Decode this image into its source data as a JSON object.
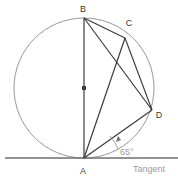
{
  "figure": {
    "background_color": "#ffffff",
    "canvas": {
      "width": 178,
      "height": 180
    }
  },
  "colors": {
    "circle_stroke": "#8c8c8c",
    "chord_stroke": "#3b3b3b",
    "tangent_stroke": "#6e6e6e",
    "label_text": "#3b3b3b",
    "muted_text": "#9a9a9a",
    "center_marker": "#3b3b3b"
  },
  "circle": {
    "center": {
      "x": 84,
      "y": 88
    },
    "radius": 70
  },
  "center_marker": {
    "name": "circle-center-dot",
    "x": 84,
    "y": 88,
    "size": 4
  },
  "points": [
    {
      "id": "B",
      "label": "B",
      "x": 84,
      "y": 18,
      "label_x": 83,
      "label_y": 12
    },
    {
      "id": "C",
      "label": "C",
      "x": 125,
      "y": 38,
      "label_x": 129,
      "label_y": 26
    },
    {
      "id": "D",
      "label": "D",
      "x": 152,
      "y": 110,
      "label_x": 159,
      "label_y": 118
    },
    {
      "id": "A",
      "label": "A",
      "x": 84,
      "y": 158,
      "label_x": 81,
      "label_y": 173
    }
  ],
  "chords": [
    {
      "from": "A",
      "to": "B",
      "x1": 84,
      "y1": 158,
      "x2": 84,
      "y2": 18
    },
    {
      "from": "B",
      "to": "C",
      "x1": 84,
      "y1": 18,
      "x2": 125,
      "y2": 38
    },
    {
      "from": "B",
      "to": "D",
      "x1": 84,
      "y1": 18,
      "x2": 152,
      "y2": 110
    },
    {
      "from": "C",
      "to": "D",
      "x1": 125,
      "y1": 38,
      "x2": 152,
      "y2": 110
    },
    {
      "from": "C",
      "to": "A",
      "x1": 125,
      "y1": 38,
      "x2": 84,
      "y2": 158
    },
    {
      "from": "A",
      "to": "D",
      "x1": 84,
      "y1": 158,
      "x2": 152,
      "y2": 110
    }
  ],
  "tangent": {
    "label": "Tangent",
    "label_x": 133,
    "label_y": 172,
    "x1": 5,
    "y1": 158,
    "x2": 178,
    "y2": 158
  },
  "angle": {
    "value": "65",
    "unit": "°",
    "label": "65°",
    "label_x": 120,
    "label_y": 155,
    "arc_path": "M 118 149 A 36 36 0 0 0 110 136",
    "arrow_path": "M 118 137 L 117 142 L 121 140 Z",
    "vertex": "A",
    "between": [
      "tangent",
      "AD"
    ]
  }
}
